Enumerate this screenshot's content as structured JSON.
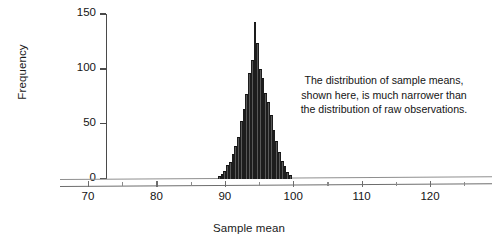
{
  "figure": {
    "annotation_lines": [
      "The distribution of sample means,",
      "shown here, is much narrower than",
      "the distribution of raw observations."
    ]
  },
  "chart_data": {
    "type": "bar",
    "title": "",
    "subtitle": "",
    "xlabel": "Sample mean",
    "ylabel": "Frequency",
    "xlim": [
      67,
      127.5
    ],
    "ylim": [
      0,
      150
    ],
    "grid": false,
    "legend": null,
    "x_ticks": [
      70,
      80,
      90,
      100,
      110,
      120
    ],
    "x_tick_labels": [
      "70",
      "80",
      "90",
      "100",
      "110",
      "120"
    ],
    "x_minor_ticks": [
      75,
      85,
      95,
      105,
      115,
      125
    ],
    "y_ticks": [
      0,
      50,
      100,
      150
    ],
    "y_tick_labels": [
      "0",
      "50",
      "100",
      "150"
    ],
    "bar_color": "#585858",
    "bar_edge_color": "#1d1d1d",
    "bin_width": 0.4,
    "bin_centers": [
      89.2,
      89.6,
      90.0,
      90.4,
      90.8,
      91.2,
      91.6,
      92.0,
      92.4,
      92.8,
      93.2,
      93.6,
      94.0,
      94.4,
      94.8,
      95.2,
      95.6,
      96.0,
      96.4,
      96.8,
      97.2,
      97.6,
      98.0,
      98.4,
      98.8,
      99.2,
      99.6
    ],
    "values": [
      2,
      4,
      7,
      12,
      15,
      22,
      30,
      38,
      52,
      63,
      77,
      96,
      108,
      143,
      124,
      100,
      92,
      78,
      70,
      58,
      44,
      34,
      24,
      16,
      11,
      6,
      3
    ],
    "annotations": [
      {
        "text": "The distribution of sample means, shown here, is much narrower than the distribution of raw observations.",
        "x": 112,
        "y": 95
      }
    ]
  }
}
